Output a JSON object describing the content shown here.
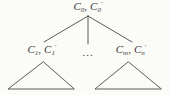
{
  "figure": {
    "background": "#fbfbf8",
    "line_color": "#4a4a4a",
    "text_color": "#3b3b3b"
  },
  "nodes": {
    "root": {
      "var1": "C",
      "sub1": "0",
      "sep": ",",
      "var2": "C",
      "sub2": "0",
      "prime2": "′"
    },
    "left_child": {
      "var1": "C",
      "sub1": "1",
      "sep": ",",
      "var2": "C",
      "sub2": "1",
      "prime2": "′"
    },
    "ellipsis": "...",
    "right_child": {
      "var1": "C",
      "sub1": "m",
      "sep": ",",
      "var2": "C",
      "sub2": "n",
      "prime2": "′"
    }
  }
}
